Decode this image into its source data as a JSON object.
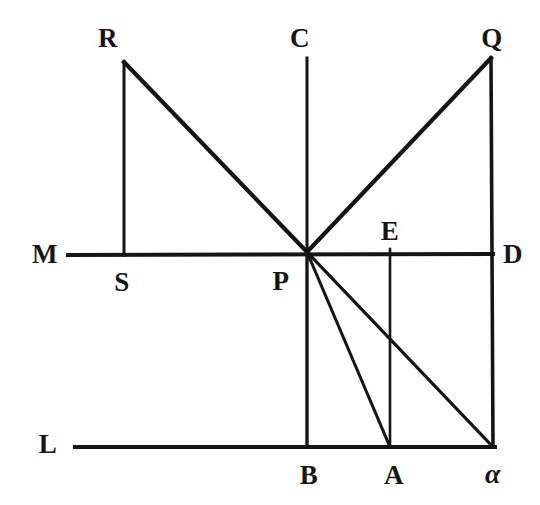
{
  "figure": {
    "kind": "geometric-line-diagram",
    "background_color": "#ffffff",
    "ink_color": "#151515",
    "width": 540,
    "height": 505
  },
  "points": [
    {
      "id": "R",
      "label": "R",
      "x": 124,
      "y": 62,
      "label_x": 108,
      "label_y": 38,
      "italic": false
    },
    {
      "id": "C",
      "label": "C",
      "x": 307,
      "y": 58,
      "label_x": 300,
      "label_y": 38,
      "italic": false
    },
    {
      "id": "Q",
      "label": "Q",
      "x": 491,
      "y": 58,
      "label_x": 492,
      "label_y": 38,
      "italic": false
    },
    {
      "id": "M",
      "label": "M",
      "x": 68,
      "y": 255,
      "label_x": 45,
      "label_y": 254,
      "italic": false
    },
    {
      "id": "E",
      "label": "E",
      "x": 390,
      "y": 255,
      "label_x": 390,
      "label_y": 231,
      "italic": false
    },
    {
      "id": "D",
      "label": "D",
      "x": 493,
      "y": 255,
      "label_x": 513,
      "label_y": 254,
      "italic": false
    },
    {
      "id": "S",
      "label": "S",
      "x": 124,
      "y": 255,
      "label_x": 122,
      "label_y": 282,
      "italic": false
    },
    {
      "id": "P",
      "label": "P",
      "x": 307,
      "y": 252,
      "label_x": 281,
      "label_y": 281,
      "italic": false
    },
    {
      "id": "L",
      "label": "L",
      "x": 75,
      "y": 447,
      "label_x": 48,
      "label_y": 444,
      "italic": false
    },
    {
      "id": "B",
      "label": "B",
      "x": 307,
      "y": 447,
      "label_x": 309,
      "label_y": 475,
      "italic": false
    },
    {
      "id": "A",
      "label": "A",
      "x": 390,
      "y": 447,
      "label_x": 394,
      "label_y": 475,
      "italic": false
    },
    {
      "id": "alpha",
      "label": "α",
      "x": 493,
      "y": 447,
      "label_x": 493,
      "label_y": 474,
      "italic": true
    }
  ],
  "segments": [
    {
      "id": "line-M-D",
      "name": "horizontal-line-MD",
      "x1": 68,
      "y1": 255,
      "x2": 493,
      "y2": 254,
      "width": 4.0
    },
    {
      "id": "line-L-alpha",
      "name": "horizontal-line-L-alpha",
      "x1": 75,
      "y1": 447,
      "x2": 495,
      "y2": 447,
      "width": 4.0
    },
    {
      "id": "line-R-S",
      "name": "vertical-line-RS",
      "x1": 124,
      "y1": 62,
      "x2": 124,
      "y2": 255,
      "width": 3.0
    },
    {
      "id": "line-C-P",
      "name": "vertical-line-CP",
      "x1": 307,
      "y1": 58,
      "x2": 307,
      "y2": 252,
      "width": 3.0
    },
    {
      "id": "line-P-B",
      "name": "vertical-line-PB",
      "x1": 307,
      "y1": 252,
      "x2": 307,
      "y2": 447,
      "width": 3.4
    },
    {
      "id": "line-E-A",
      "name": "vertical-line-EA",
      "x1": 390,
      "y1": 249,
      "x2": 390,
      "y2": 447,
      "width": 2.6
    },
    {
      "id": "line-Q-alpha",
      "name": "vertical-line-Q-alpha",
      "x1": 491,
      "y1": 58,
      "x2": 493,
      "y2": 447,
      "width": 3.6
    },
    {
      "id": "line-R-P",
      "name": "diagonal-line-RP",
      "x1": 124,
      "y1": 62,
      "x2": 307,
      "y2": 252,
      "width": 4.2
    },
    {
      "id": "line-P-Q",
      "name": "diagonal-line-PQ",
      "x1": 307,
      "y1": 252,
      "x2": 491,
      "y2": 58,
      "width": 4.2
    },
    {
      "id": "line-P-A",
      "name": "diagonal-line-PA",
      "x1": 307,
      "y1": 252,
      "x2": 390,
      "y2": 447,
      "width": 3.0
    },
    {
      "id": "line-P-alpha",
      "name": "diagonal-line-P-alpha",
      "x1": 307,
      "y1": 252,
      "x2": 493,
      "y2": 447,
      "width": 3.2
    }
  ]
}
